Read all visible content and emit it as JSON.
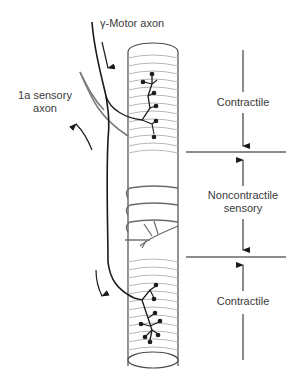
{
  "labels": {
    "gamma_motor_axon": "γ-Motor axon",
    "sensory_axon_line1": "1a sensory",
    "sensory_axon_line2": "axon",
    "region_top": "Contractile",
    "region_middle_line1": "Noncontractile",
    "region_middle_line2": "sensory",
    "region_bottom": "Contractile"
  },
  "colors": {
    "ink": "#1a1a1a",
    "fiber_outline": "#4a4a4a",
    "striation": "#b8b8b8",
    "sensory_axon": "#7a7a7a",
    "annulospiral": "#6a6a6a",
    "text": "#3a3a3a"
  },
  "regions": [
    {
      "name": "contractile-top",
      "y_start": 30,
      "y_end": 153
    },
    {
      "name": "noncontractile-sensory",
      "y_start": 153,
      "y_end": 258
    },
    {
      "name": "contractile-bottom",
      "y_start": 258,
      "y_end": 368
    }
  ]
}
